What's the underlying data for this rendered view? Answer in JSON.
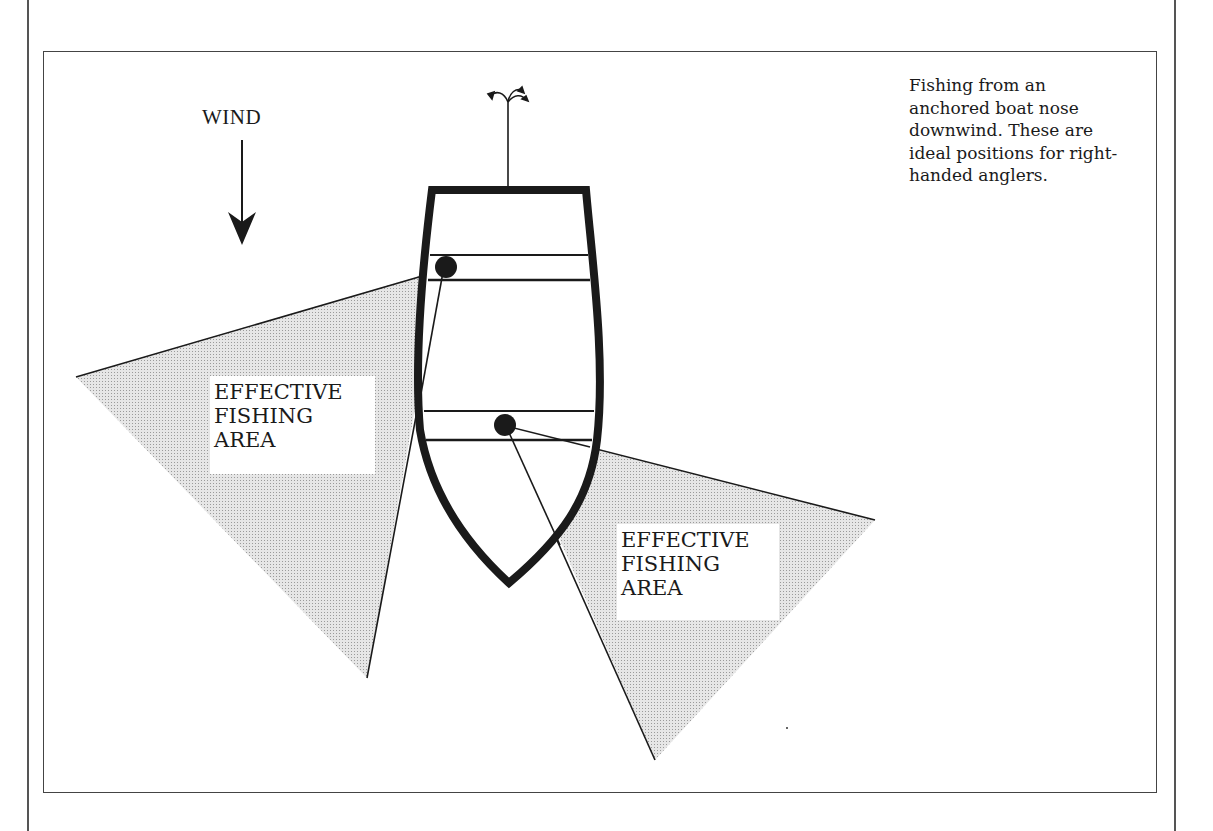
{
  "caption": {
    "lines": [
      "Fishing from an",
      "anchored boat nose",
      "downwind. These are",
      "ideal positions for right-",
      "handed anglers."
    ]
  },
  "wind": {
    "label": "WIND",
    "icon": "arrow-down-icon",
    "direction": "down"
  },
  "areas": [
    {
      "id": "left",
      "lines": [
        "EFFECTIVE",
        "FISHING",
        "AREA"
      ]
    },
    {
      "id": "right",
      "lines": [
        "EFFECTIVE",
        "FISHING",
        "AREA"
      ]
    }
  ],
  "boat": {
    "orientation": "bow downwind",
    "anglers": 2,
    "anchor_icon": "anchor-rope-icon"
  },
  "colors": {
    "ink": "#1a1a1a",
    "shade": "#d4d4d4",
    "frame": "#444444",
    "background": "#ffffff"
  }
}
